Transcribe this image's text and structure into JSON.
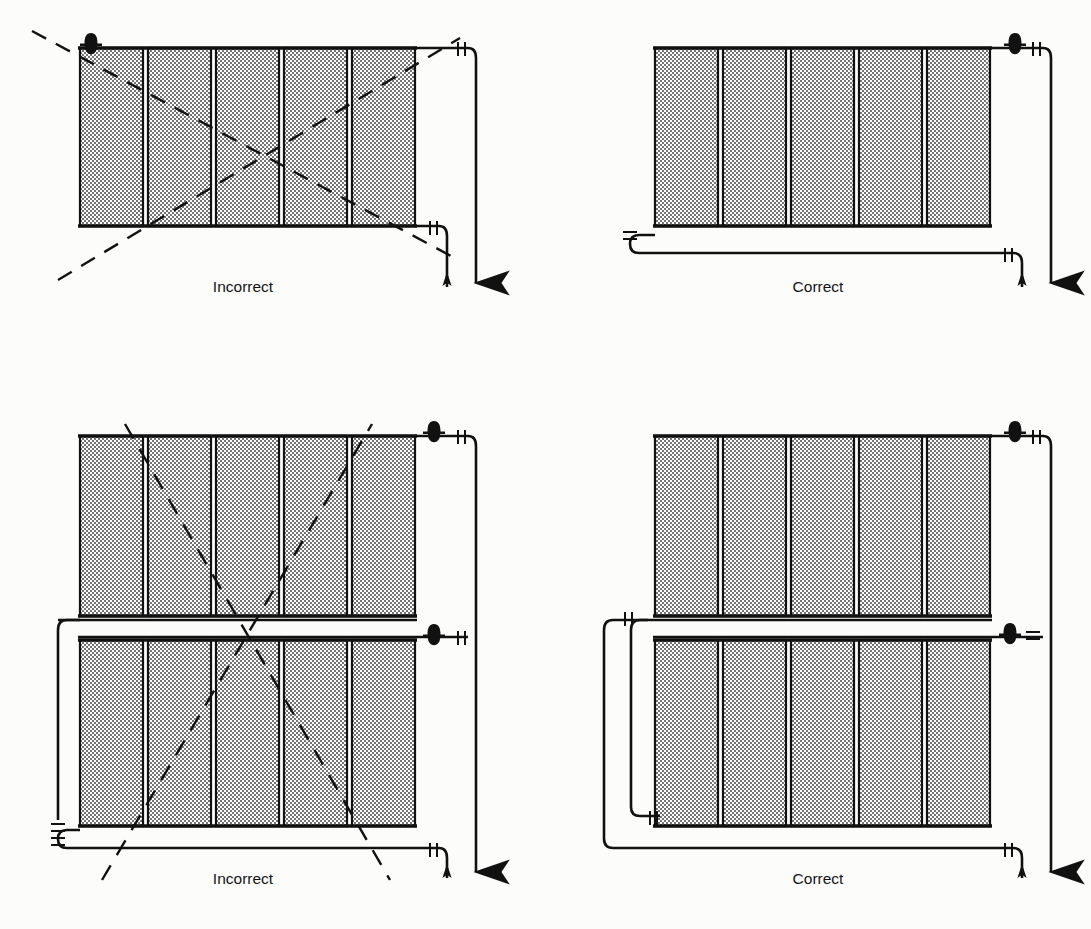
{
  "document": {
    "kind": "technical-illustration",
    "subject": "Radiator supply and return piping connection details",
    "background_color": "#fcfcfb",
    "ink_color": "#111111",
    "section_fill_color": "#d8d8d8"
  },
  "panels": [
    {
      "id": "top-left",
      "caption": "Incorrect",
      "marked_wrong": true,
      "radiator_rows": 1,
      "sections_per_row": 5,
      "air_vent_count": 1,
      "air_vent_positions": [
        "top-left"
      ],
      "supply_arrow": "down",
      "return_arrow": "up",
      "note": "Single-row radiator, vent at top left, supply and return both taken from right end"
    },
    {
      "id": "top-right",
      "caption": "Correct",
      "marked_wrong": false,
      "radiator_rows": 1,
      "sections_per_row": 5,
      "air_vent_count": 1,
      "air_vent_positions": [
        "top-right"
      ],
      "supply_arrow": "down",
      "return_arrow": "up",
      "note": "Single-row radiator, vent at top right, return bend at bottom left with unions"
    },
    {
      "id": "bottom-left",
      "caption": "Incorrect",
      "marked_wrong": true,
      "radiator_rows": 2,
      "sections_per_row": 5,
      "air_vent_count": 2,
      "air_vent_positions": [
        "top-right",
        "middle-right"
      ],
      "supply_arrow": "down",
      "return_arrow": "up",
      "note": "Two stacked radiator banks, left risers crossing, marked incorrect"
    },
    {
      "id": "bottom-right",
      "caption": "Correct",
      "marked_wrong": false,
      "radiator_rows": 2,
      "sections_per_row": 5,
      "air_vent_count": 2,
      "air_vent_positions": [
        "top-right",
        "middle-right"
      ],
      "supply_arrow": "down",
      "return_arrow": "up",
      "note": "Two stacked radiator banks, parallel left risers, unions shown"
    }
  ],
  "symbols": [
    {
      "name": "air-vent",
      "glyph": "mushroom-cap",
      "count_total": 6
    },
    {
      "name": "union-fitting",
      "glyph": "double-tick",
      "description": "paired short cross ticks on pipe run"
    },
    {
      "name": "flow-arrow-down",
      "glyph": "arrow-down",
      "meaning": "supply"
    },
    {
      "name": "flow-arrow-up",
      "glyph": "arrow-up",
      "meaning": "return"
    },
    {
      "name": "cross-out",
      "glyph": "dashed-X",
      "meaning": "incorrect arrangement"
    }
  ],
  "captions": {
    "incorrect": "Incorrect",
    "correct": "Correct"
  }
}
